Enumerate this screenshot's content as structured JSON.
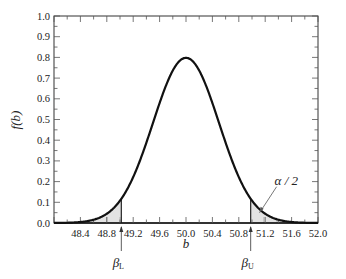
{
  "chart_data": {
    "type": "area",
    "title": "",
    "xlabel": "b",
    "ylabel": "f(b)",
    "xlim": [
      48.0,
      52.0
    ],
    "ylim": [
      0.0,
      1.0
    ],
    "grid": false,
    "legend": null,
    "x_ticks": [
      "48.4",
      "48.8",
      "49.2",
      "49.6",
      "50.0",
      "50.4",
      "50.8",
      "51.2",
      "51.6",
      "52.0"
    ],
    "y_ticks": [
      "0.0",
      "0.1",
      "0.2",
      "0.3",
      "0.4",
      "0.5",
      "0.6",
      "0.7",
      "0.8",
      "0.9",
      "1.0"
    ],
    "curve": {
      "distribution": "normal",
      "mean": 50.0,
      "std": 0.5,
      "peak": 0.8
    },
    "x": [
      48.0,
      48.4,
      48.8,
      49.0,
      49.2,
      49.6,
      50.0,
      50.4,
      50.8,
      51.0,
      51.2,
      51.6,
      52.0
    ],
    "values": [
      0.0001,
      0.0044,
      0.0448,
      0.108,
      0.2218,
      0.5794,
      0.7979,
      0.5794,
      0.2218,
      0.108,
      0.0448,
      0.0044,
      0.0001
    ],
    "shaded_regions": [
      {
        "from": 48.0,
        "to": 49.02,
        "label": "lower tail"
      },
      {
        "from": 50.98,
        "to": 52.0,
        "label": "upper tail"
      }
    ],
    "annotations": [
      {
        "text": "β_L",
        "x": 49.02,
        "type": "arrow-up"
      },
      {
        "text": "β_U",
        "x": 50.98,
        "type": "arrow-up"
      },
      {
        "text": "α/2",
        "x": 51.2,
        "y": 0.12,
        "type": "pointer"
      }
    ]
  },
  "labels": {
    "xlabel": "b",
    "ylabel": "f(b)",
    "beta_l": "β",
    "beta_l_sub": "L",
    "beta_u": "β",
    "beta_u_sub": "U",
    "alpha": "α / 2"
  }
}
